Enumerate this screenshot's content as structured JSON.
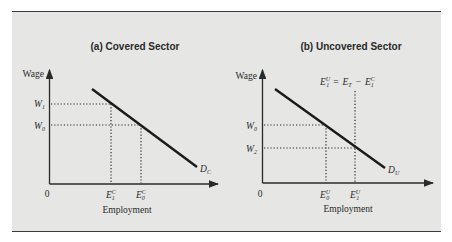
{
  "figure": {
    "panels": [
      {
        "title": "(a) Covered Sector",
        "y_axis_label": "Wage",
        "x_axis_label": "Employment",
        "origin_label": "0",
        "wage_levels": [
          {
            "symbol": "W",
            "sub": "1"
          },
          {
            "symbol": "W",
            "sub": "0"
          }
        ],
        "employment_levels": [
          {
            "symbol": "E",
            "sup": "C",
            "sub": "1"
          },
          {
            "symbol": "E",
            "sup": "C",
            "sub": "0"
          }
        ],
        "curve_label": {
          "symbol": "D",
          "sub": "C"
        }
      },
      {
        "title": "(b) Uncovered Sector",
        "y_axis_label": "Wage",
        "x_axis_label": "Employment",
        "origin_label": "0",
        "annotation": {
          "lhs": {
            "symbol": "E",
            "sup": "U",
            "sub": "1"
          },
          "eq": "=",
          "mid": {
            "symbol": "E",
            "sub": "T"
          },
          "minus": "−",
          "rhs": {
            "symbol": "E",
            "sup": "C",
            "sub": "1"
          }
        },
        "wage_levels": [
          {
            "symbol": "W",
            "sub": "0"
          },
          {
            "symbol": "W",
            "sub": "2"
          }
        ],
        "employment_levels": [
          {
            "symbol": "E",
            "sup": "U",
            "sub": "0"
          },
          {
            "symbol": "E",
            "sup": "U",
            "sub": "1"
          }
        ],
        "curve_label": {
          "symbol": "D",
          "sub": "U"
        }
      }
    ]
  }
}
